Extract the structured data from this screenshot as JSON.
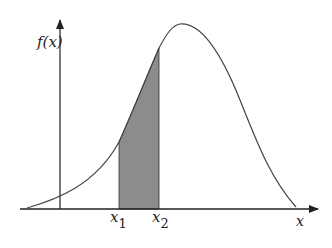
{
  "diagram": {
    "title": "",
    "y_axis_label": "f(x)",
    "x_axis_label": "x",
    "bounds": [
      {
        "base": "x",
        "sub": "1"
      },
      {
        "base": "x",
        "sub": "2"
      }
    ],
    "colors": {
      "curve": "#444444",
      "axis": "#222222",
      "shaded_region": "#8c8c8c",
      "background": "#ffffff"
    }
  }
}
